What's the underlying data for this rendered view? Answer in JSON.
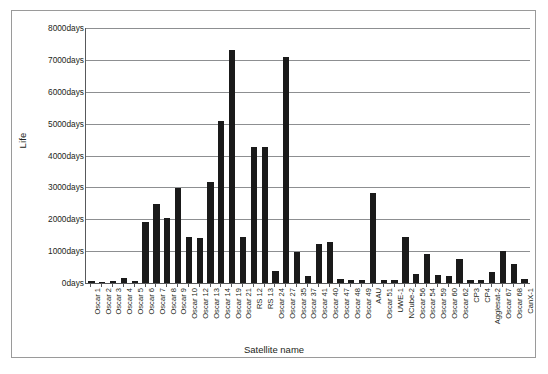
{
  "chart_data": {
    "type": "bar",
    "title": "",
    "xlabel": "Satellite name",
    "ylabel": "Life",
    "ylim": [
      0,
      8000
    ],
    "y_tick_values": [
      0,
      1000,
      2000,
      3000,
      4000,
      5000,
      6000,
      7000,
      8000
    ],
    "y_tick_labels": [
      "0days",
      "1000days",
      "2000days",
      "3000days",
      "4000days",
      "5000days",
      "6000days",
      "7000days",
      "8000days"
    ],
    "grid": true,
    "legend": false,
    "bar_color": "#1a1a1a",
    "categories": [
      "Oscar 1",
      "Oscar 2",
      "Oscar 3",
      "Oscar 4",
      "Oscar 5",
      "Oscar 6",
      "Oscar 7",
      "Oscar 8",
      "Oscar 9",
      "Oscar 10",
      "Oscar 12",
      "Oscar 13",
      "Oscar 14",
      "Oscar 19",
      "Oscar 21",
      "RS 12",
      "RS 13",
      "Oscar 24",
      "Oscar 27",
      "Oscar 35",
      "Oscar 37",
      "Oscar 41",
      "Oscar 40",
      "Oscar 47",
      "Oscar 48",
      "Oscar 49",
      "AAU",
      "Oscar 51",
      "UWE-1",
      "NCube-2",
      "Oscar 56",
      "Oscar 54",
      "Oscar 59",
      "Oscar 60",
      "Oscar 62",
      "CP3",
      "CP4",
      "Agglesat-2",
      "Oscar 67",
      "Oscar 68",
      "CanX-1"
    ],
    "values": [
      60,
      40,
      50,
      170,
      60,
      1900,
      2480,
      2050,
      2980,
      1450,
      1420,
      3180,
      5080,
      7300,
      1450,
      4280,
      4280,
      380,
      7100,
      980,
      230,
      1220,
      1280,
      140,
      110,
      100,
      2830,
      90,
      110,
      1450,
      280,
      900,
      260,
      220,
      750,
      80,
      90,
      330,
      1010,
      600,
      130
    ]
  }
}
